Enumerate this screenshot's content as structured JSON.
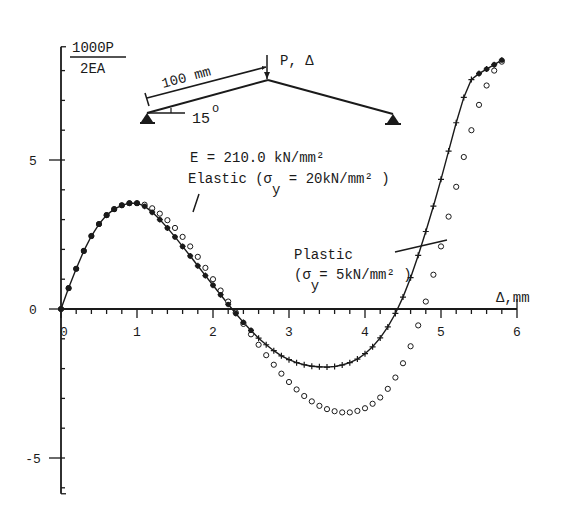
{
  "chart_data": {
    "type": "line",
    "title": "",
    "ylabel_numerator": "1000P",
    "ylabel_denominator": "2EA",
    "xlabel": "Δ,mm",
    "xlim": [
      0,
      6
    ],
    "ylim": [
      -6.2,
      8.8
    ],
    "x_ticks": [
      "0",
      "1",
      "2",
      "3",
      "4",
      "5",
      "6"
    ],
    "y_ticks": [
      "-5",
      "0",
      "5"
    ],
    "grid": false,
    "annotations": {
      "modulus": "E = 210.0 kN/mm²",
      "elastic": "Elastic (σ",
      "elastic_sub": "y",
      "elastic_tail": " = 20kN/mm² )",
      "plastic": "Plastic",
      "plastic2": "(σ",
      "plastic_sub": "y",
      "plastic2_tail": "= 5kN/mm² )",
      "inset_length": "100 mm",
      "inset_angle": "15",
      "inset_angle_unit": "o",
      "inset_load": "P, Δ"
    },
    "series": [
      {
        "name": "Elastic (σy = 20kN/mm²)",
        "marker": "circle",
        "x": [
          0,
          0.1,
          0.2,
          0.3,
          0.4,
          0.5,
          0.6,
          0.7,
          0.8,
          0.9,
          1.0,
          1.1,
          1.2,
          1.3,
          1.4,
          1.5,
          1.6,
          1.7,
          1.8,
          1.9,
          2.0,
          2.1,
          2.2,
          2.3,
          2.4,
          2.5,
          2.6,
          2.7,
          2.8,
          2.9,
          3.0,
          3.1,
          3.2,
          3.3,
          3.4,
          3.5,
          3.6,
          3.7,
          3.8,
          3.9,
          4.0,
          4.1,
          4.2,
          4.3,
          4.4,
          4.5,
          4.6,
          4.7,
          4.8,
          4.9,
          5.0,
          5.1,
          5.2,
          5.3,
          5.4,
          5.5,
          5.6,
          5.7,
          5.8
        ],
        "y": [
          0,
          0.7,
          1.35,
          1.95,
          2.45,
          2.85,
          3.15,
          3.35,
          3.48,
          3.55,
          3.55,
          3.5,
          3.38,
          3.2,
          2.98,
          2.72,
          2.42,
          2.1,
          1.75,
          1.38,
          1.0,
          0.62,
          0.25,
          -0.12,
          -0.5,
          -0.85,
          -1.2,
          -1.55,
          -1.87,
          -2.17,
          -2.45,
          -2.7,
          -2.92,
          -3.1,
          -3.25,
          -3.36,
          -3.43,
          -3.47,
          -3.47,
          -3.42,
          -3.33,
          -3.18,
          -2.97,
          -2.68,
          -2.3,
          -1.82,
          -1.25,
          -0.55,
          0.25,
          1.15,
          2.1,
          3.1,
          4.1,
          5.1,
          6.0,
          6.85,
          7.5,
          8.0,
          8.3
        ]
      },
      {
        "name": "Plastic (σy = 5kN/mm²)",
        "marker": "plus",
        "x": [
          0,
          0.1,
          0.2,
          0.3,
          0.4,
          0.5,
          0.6,
          0.7,
          0.8,
          0.9,
          1.0,
          1.1,
          1.2,
          1.3,
          1.4,
          1.5,
          1.6,
          1.7,
          1.8,
          1.9,
          2.0,
          2.1,
          2.2,
          2.3,
          2.4,
          2.5,
          2.6,
          2.7,
          2.8,
          2.9,
          3.0,
          3.1,
          3.2,
          3.3,
          3.4,
          3.5,
          3.6,
          3.7,
          3.8,
          3.9,
          4.0,
          4.1,
          4.2,
          4.3,
          4.4,
          4.5,
          4.6,
          4.7,
          4.8,
          4.9,
          5.0,
          5.1,
          5.2,
          5.3,
          5.4,
          5.5,
          5.6,
          5.7,
          5.8
        ],
        "y": [
          0,
          0.7,
          1.35,
          1.95,
          2.45,
          2.85,
          3.15,
          3.35,
          3.48,
          3.55,
          3.55,
          3.45,
          3.25,
          3.0,
          2.72,
          2.42,
          2.1,
          1.78,
          1.45,
          1.12,
          0.8,
          0.48,
          0.16,
          -0.15,
          -0.45,
          -0.72,
          -0.98,
          -1.2,
          -1.4,
          -1.57,
          -1.7,
          -1.8,
          -1.87,
          -1.92,
          -1.94,
          -1.95,
          -1.93,
          -1.88,
          -1.8,
          -1.68,
          -1.5,
          -1.27,
          -0.97,
          -0.6,
          -0.15,
          0.4,
          1.05,
          1.8,
          2.6,
          3.45,
          4.35,
          5.3,
          6.25,
          7.1,
          7.7,
          7.9,
          8.05,
          8.2,
          8.35
        ]
      }
    ]
  }
}
